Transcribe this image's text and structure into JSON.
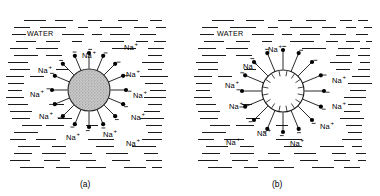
{
  "figure": {
    "type": "scientific-diagram",
    "background_color": "#ffffff",
    "line_color": "#1a1a1a"
  },
  "panels": [
    {
      "id": "a",
      "caption": "(a)",
      "water_label": "WATER",
      "particle": {
        "style": "filled-stippled",
        "fill_color": "#b4b4b4",
        "radius_px": 21,
        "center_x": 89,
        "center_y": 90,
        "charge_count": 16,
        "charge_sign": "−",
        "charge_dot_color": "#000000",
        "spoke_length_px": 16
      },
      "ions": [
        {
          "label": "Na",
          "charge": "+",
          "x": 82,
          "y": 49
        },
        {
          "label": "Na",
          "charge": "+",
          "x": 124,
          "y": 41
        },
        {
          "label": "Na",
          "charge": "+",
          "x": 38,
          "y": 64
        },
        {
          "label": "Na",
          "charge": "+",
          "x": 126,
          "y": 68
        },
        {
          "label": "Na",
          "charge": "+",
          "x": 30,
          "y": 88
        },
        {
          "label": "Na",
          "charge": "+",
          "x": 133,
          "y": 89
        },
        {
          "label": "Na",
          "charge": "+",
          "x": 39,
          "y": 110
        },
        {
          "label": "Na",
          "charge": "+",
          "x": 131,
          "y": 111
        },
        {
          "label": "Na",
          "charge": "+",
          "x": 66,
          "y": 131
        },
        {
          "label": "Na",
          "charge": "+",
          "x": 103,
          "y": 128
        },
        {
          "label": "Na",
          "charge": "+",
          "x": 126,
          "y": 137
        }
      ]
    },
    {
      "id": "b",
      "caption": "(b)",
      "water_label": "WATER",
      "particle": {
        "style": "hollow-sunburst",
        "fill_color": "#ffffff",
        "radius_px": 21,
        "center_x": 283,
        "center_y": 91,
        "charge_count": 16,
        "charge_sign": "−",
        "charge_dot_color": "#000000",
        "spoke_length_px": 20,
        "inner_tick_length_px": 6
      },
      "ions": [
        {
          "label": "Na",
          "charge": "+",
          "x": 268,
          "y": 43
        },
        {
          "label": "Na",
          "charge": "+",
          "x": 243,
          "y": 60
        },
        {
          "label": "Na",
          "charge": "+",
          "x": 225,
          "y": 79
        },
        {
          "label": "Na",
          "charge": "+",
          "x": 332,
          "y": 74
        },
        {
          "label": "Na",
          "charge": "+",
          "x": 229,
          "y": 100
        },
        {
          "label": "Na",
          "charge": "+",
          "x": 332,
          "y": 100
        },
        {
          "label": "Na",
          "charge": "+",
          "x": 320,
          "y": 120
        },
        {
          "label": "Na",
          "charge": "+",
          "x": 257,
          "y": 127
        },
        {
          "label": "Na",
          "charge": "+",
          "x": 226,
          "y": 136
        },
        {
          "label": "Na",
          "charge": "+",
          "x": 290,
          "y": 137
        }
      ]
    }
  ],
  "water_dashes": {
    "a": [
      [
        24,
        20,
        22
      ],
      [
        55,
        20,
        18
      ],
      [
        88,
        20,
        14
      ],
      [
        118,
        20,
        20
      ],
      [
        150,
        20,
        12
      ],
      [
        14,
        27,
        16
      ],
      [
        40,
        27,
        26
      ],
      [
        78,
        27,
        10
      ],
      [
        100,
        27,
        22
      ],
      [
        134,
        27,
        14
      ],
      [
        156,
        27,
        10
      ],
      [
        12,
        34,
        14
      ],
      [
        62,
        34,
        22
      ],
      [
        92,
        34,
        10
      ],
      [
        110,
        34,
        20
      ],
      [
        140,
        34,
        16
      ],
      [
        16,
        41,
        20
      ],
      [
        46,
        41,
        14
      ],
      [
        72,
        41,
        10
      ],
      [
        100,
        41,
        24
      ],
      [
        136,
        41,
        12
      ],
      [
        154,
        41,
        12
      ],
      [
        10,
        48,
        18
      ],
      [
        36,
        48,
        22
      ],
      [
        112,
        48,
        24
      ],
      [
        148,
        48,
        16
      ],
      [
        14,
        55,
        24
      ],
      [
        46,
        55,
        16
      ],
      [
        148,
        55,
        14
      ],
      [
        8,
        62,
        14
      ],
      [
        18,
        62,
        10
      ],
      [
        142,
        62,
        22
      ],
      [
        10,
        69,
        20
      ],
      [
        56,
        69,
        12
      ],
      [
        148,
        69,
        14
      ],
      [
        6,
        76,
        18
      ],
      [
        30,
        76,
        14
      ],
      [
        140,
        76,
        20
      ],
      [
        160,
        76,
        8
      ],
      [
        8,
        83,
        16
      ],
      [
        145,
        83,
        18
      ],
      [
        8,
        90,
        14
      ],
      [
        150,
        90,
        16
      ],
      [
        6,
        97,
        18
      ],
      [
        144,
        97,
        22
      ],
      [
        8,
        104,
        20
      ],
      [
        54,
        104,
        10
      ],
      [
        148,
        104,
        14
      ],
      [
        10,
        111,
        22
      ],
      [
        144,
        111,
        16
      ],
      [
        12,
        118,
        18
      ],
      [
        58,
        118,
        14
      ],
      [
        140,
        118,
        24
      ],
      [
        22,
        125,
        20
      ],
      [
        46,
        125,
        18
      ],
      [
        86,
        125,
        12
      ],
      [
        146,
        125,
        16
      ],
      [
        14,
        132,
        24
      ],
      [
        148,
        132,
        14
      ],
      [
        10,
        139,
        16
      ],
      [
        36,
        139,
        20
      ],
      [
        88,
        139,
        26
      ],
      [
        142,
        139,
        20
      ],
      [
        18,
        146,
        22
      ],
      [
        52,
        146,
        14
      ],
      [
        96,
        146,
        18
      ],
      [
        132,
        146,
        24
      ],
      [
        14,
        153,
        18
      ],
      [
        42,
        153,
        24
      ],
      [
        80,
        153,
        12
      ],
      [
        106,
        153,
        22
      ],
      [
        144,
        153,
        14
      ],
      [
        10,
        160,
        20
      ],
      [
        44,
        160,
        16
      ],
      [
        70,
        160,
        26
      ],
      [
        112,
        160,
        18
      ],
      [
        146,
        160,
        16
      ],
      [
        20,
        167,
        24
      ],
      [
        56,
        167,
        14
      ],
      [
        86,
        167,
        20
      ],
      [
        124,
        167,
        22
      ],
      [
        152,
        167,
        10
      ]
    ],
    "b": [
      [
        212,
        20,
        22
      ],
      [
        246,
        20,
        18
      ],
      [
        278,
        20,
        14
      ],
      [
        306,
        20,
        20
      ],
      [
        340,
        20,
        12
      ],
      [
        358,
        20,
        10
      ],
      [
        202,
        27,
        16
      ],
      [
        230,
        27,
        26
      ],
      [
        268,
        27,
        10
      ],
      [
        290,
        27,
        22
      ],
      [
        322,
        27,
        14
      ],
      [
        346,
        27,
        10
      ],
      [
        364,
        27,
        8
      ],
      [
        200,
        34,
        14
      ],
      [
        252,
        34,
        22
      ],
      [
        282,
        34,
        10
      ],
      [
        300,
        34,
        20
      ],
      [
        330,
        34,
        16
      ],
      [
        356,
        34,
        12
      ],
      [
        204,
        41,
        20
      ],
      [
        236,
        41,
        14
      ],
      [
        262,
        41,
        10
      ],
      [
        290,
        41,
        24
      ],
      [
        326,
        41,
        12
      ],
      [
        346,
        41,
        14
      ],
      [
        366,
        41,
        6
      ],
      [
        198,
        48,
        18
      ],
      [
        226,
        48,
        22
      ],
      [
        302,
        48,
        24
      ],
      [
        338,
        48,
        16
      ],
      [
        360,
        48,
        10
      ],
      [
        202,
        55,
        24
      ],
      [
        236,
        55,
        16
      ],
      [
        336,
        55,
        14
      ],
      [
        358,
        55,
        12
      ],
      [
        196,
        62,
        14
      ],
      [
        208,
        62,
        10
      ],
      [
        330,
        62,
        22
      ],
      [
        360,
        62,
        10
      ],
      [
        198,
        69,
        20
      ],
      [
        244,
        69,
        12
      ],
      [
        336,
        69,
        14
      ],
      [
        358,
        69,
        12
      ],
      [
        194,
        76,
        18
      ],
      [
        218,
        76,
        14
      ],
      [
        352,
        76,
        18
      ],
      [
        196,
        83,
        16
      ],
      [
        348,
        83,
        20
      ],
      [
        368,
        83,
        4
      ],
      [
        196,
        90,
        14
      ],
      [
        350,
        90,
        16
      ],
      [
        194,
        97,
        18
      ],
      [
        344,
        97,
        22
      ],
      [
        196,
        104,
        20
      ],
      [
        242,
        104,
        10
      ],
      [
        348,
        104,
        14
      ],
      [
        198,
        111,
        22
      ],
      [
        344,
        111,
        16
      ],
      [
        200,
        118,
        18
      ],
      [
        246,
        118,
        14
      ],
      [
        340,
        118,
        24
      ],
      [
        210,
        125,
        20
      ],
      [
        236,
        125,
        18
      ],
      [
        276,
        125,
        12
      ],
      [
        346,
        125,
        16
      ],
      [
        202,
        132,
        24
      ],
      [
        348,
        132,
        14
      ],
      [
        198,
        139,
        16
      ],
      [
        224,
        139,
        20
      ],
      [
        276,
        139,
        26
      ],
      [
        342,
        139,
        20
      ],
      [
        206,
        146,
        22
      ],
      [
        240,
        146,
        14
      ],
      [
        284,
        146,
        18
      ],
      [
        320,
        146,
        24
      ],
      [
        352,
        146,
        10
      ],
      [
        202,
        153,
        18
      ],
      [
        230,
        153,
        24
      ],
      [
        268,
        153,
        12
      ],
      [
        294,
        153,
        22
      ],
      [
        332,
        153,
        14
      ],
      [
        356,
        153,
        10
      ],
      [
        198,
        160,
        20
      ],
      [
        232,
        160,
        16
      ],
      [
        258,
        160,
        26
      ],
      [
        300,
        160,
        18
      ],
      [
        334,
        160,
        16
      ],
      [
        358,
        160,
        8
      ],
      [
        208,
        167,
        24
      ],
      [
        244,
        167,
        14
      ],
      [
        274,
        167,
        20
      ],
      [
        312,
        167,
        22
      ],
      [
        344,
        167,
        16
      ]
    ]
  },
  "captions": {
    "a": {
      "text": "(a)",
      "x": 80,
      "y": 180
    },
    "b": {
      "text": "(b)",
      "x": 272,
      "y": 180
    }
  },
  "water_labels": {
    "a": {
      "text": "WATER",
      "x": 26,
      "y": 30
    },
    "b": {
      "text": "WATER",
      "x": 216,
      "y": 30
    }
  }
}
